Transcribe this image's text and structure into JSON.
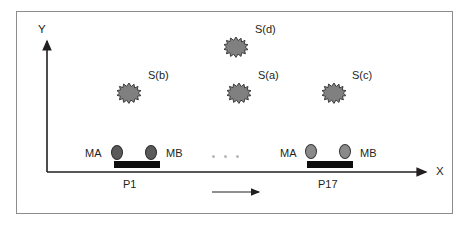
{
  "figure": {
    "type": "schematic-diagram",
    "background": "#ffffff",
    "frame_border_color": "#8c8c8c"
  },
  "axes": {
    "y_label": "Y",
    "x_label": "X",
    "axis_color": "#231f20",
    "origin": {
      "x": 47,
      "y": 172
    },
    "x_end": {
      "x": 430,
      "y": 172
    },
    "y_end": {
      "x": 47,
      "y": 37
    }
  },
  "sources": [
    {
      "id": "star-b",
      "label": "S(b)",
      "cx": 129,
      "cy": 93,
      "label_x": 148,
      "label_y": 76,
      "color": "#808080",
      "outline": "#3d3d3d"
    },
    {
      "id": "star-d",
      "label": "S(d)",
      "cx": 236,
      "cy": 47,
      "label_x": 255,
      "label_y": 30,
      "color": "#808080",
      "outline": "#3d3d3d"
    },
    {
      "id": "star-a",
      "label": "S(a)",
      "cx": 239,
      "cy": 93,
      "label_x": 258,
      "label_y": 76,
      "color": "#808080",
      "outline": "#3d3d3d"
    },
    {
      "id": "star-c",
      "label": "S(c)",
      "cx": 334,
      "cy": 93,
      "label_x": 352,
      "label_y": 76,
      "color": "#808080",
      "outline": "#3d3d3d"
    }
  ],
  "platforms": [
    {
      "id": "p1",
      "name": "P1",
      "name_x": 130,
      "name_y": 177,
      "bar": {
        "x": 114,
        "y": 166,
        "width": 46,
        "height": 7
      },
      "sensor_a": {
        "label": "MA",
        "label_x": 85,
        "label_y": 148,
        "cx": 117,
        "cy": 152,
        "style": "ell-a"
      },
      "sensor_b": {
        "label": "MB",
        "label_x": 166,
        "label_y": 148,
        "cx": 151,
        "cy": 152,
        "style": "ell-a"
      }
    },
    {
      "id": "p17",
      "name": "P17",
      "name_x": 325,
      "name_y": 177,
      "bar": {
        "x": 307,
        "y": 166,
        "width": 46,
        "height": 7
      },
      "sensor_a": {
        "label": "MA",
        "label_x": 280,
        "label_y": 148,
        "cx": 311,
        "cy": 149,
        "style": "ell-b"
      },
      "sensor_b": {
        "label": "MB",
        "label_x": 360,
        "label_y": 148,
        "cx": 345,
        "cy": 149,
        "style": "ell-b"
      }
    }
  ],
  "ellipsis_dots": [
    {
      "x": 212,
      "y": 155
    },
    {
      "x": 224,
      "y": 155
    },
    {
      "x": 236,
      "y": 155
    }
  ],
  "direction_arrow": {
    "description": "motion direction arrow pointing right",
    "x1": 212,
    "y1": 192,
    "x2": 263,
    "y2": 192,
    "color": "#231f20"
  }
}
